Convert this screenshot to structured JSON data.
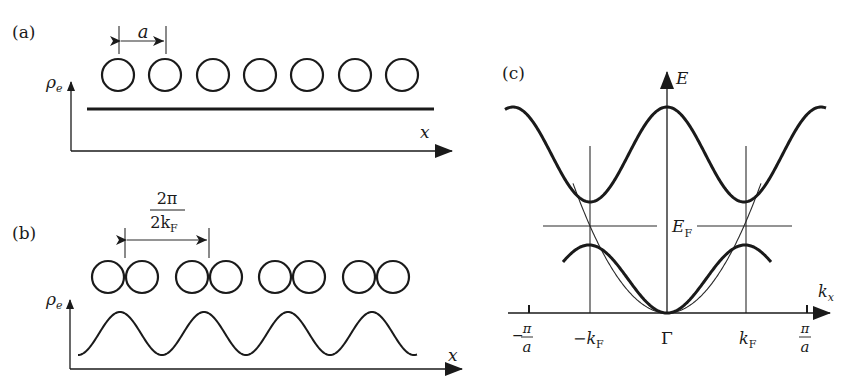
{
  "figure": {
    "panels": [
      {
        "id": "a",
        "label": "(a)",
        "y_axis_label": "ρ",
        "y_axis_sub": "e",
        "x_axis_label": "x",
        "spacing_label": "a",
        "atom_count": 7,
        "density": "uniform"
      },
      {
        "id": "b",
        "label": "(b)",
        "y_axis_label": "ρ",
        "y_axis_sub": "e",
        "x_axis_label": "x",
        "spacing_numerator": "2π",
        "spacing_denominator_main": "2k",
        "spacing_denominator_sub": "F",
        "dimer_count": 4,
        "density": "modulated (charge density wave)"
      },
      {
        "id": "c",
        "label": "(c)",
        "y_axis_label": "E",
        "x_axis_label_main": "k",
        "x_axis_label_sub": "x",
        "fermi_label_main": "E",
        "fermi_label_sub": "F",
        "ticks": {
          "neg_pi_a_sign": "−",
          "pi": "π",
          "a": "a",
          "neg_kf_main": "−k",
          "kf_main": "k",
          "kf_sub": "F",
          "gamma": "Γ"
        }
      }
    ]
  }
}
